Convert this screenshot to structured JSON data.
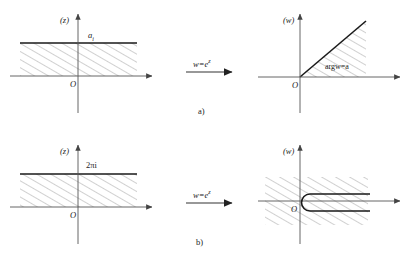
{
  "figure": {
    "title_captions": {
      "panel_a": "a)",
      "panel_b": "b)"
    },
    "panels": [
      {
        "id": "a-left",
        "plane_label": "(z)",
        "origin_label": "O",
        "boundary_label": "a",
        "boundary_label_sub": "i",
        "region_description": "horizontal strip between real axis and line Im z = a, hatched"
      },
      {
        "id": "a-map",
        "map_label": "w",
        "map_equals": "=e",
        "map_exponent": "z",
        "arrow": "right-arrow"
      },
      {
        "id": "a-right",
        "plane_label": "(w)",
        "origin_label": "O",
        "region_label": "argw=a",
        "region_description": "angular wedge from positive real axis to ray arg w = a, hatched"
      },
      {
        "id": "b-left",
        "plane_label": "(z)",
        "origin_label": "O",
        "boundary_label": "2πi",
        "region_description": "horizontal strip of height 2 pi i, hatched"
      },
      {
        "id": "b-map",
        "map_label": "w",
        "map_equals": "=e",
        "map_exponent": "z",
        "arrow": "right-arrow"
      },
      {
        "id": "b-right",
        "plane_label": "(w)",
        "origin_label": "O",
        "region_description": "full plane slit along positive real axis, hatched"
      }
    ],
    "colors": {
      "ink": "#1a1a1a",
      "axis": "#555555",
      "hatch": "#888888",
      "boundary": "#1a1a1a",
      "background": "#ffffff"
    }
  }
}
